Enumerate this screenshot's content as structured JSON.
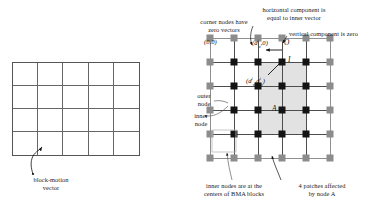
{
  "figure": {
    "left_panel": {
      "grid": {
        "cols": 5,
        "rows": 4
      },
      "arrow_caption": "block-motion\nvector"
    },
    "right_panel": {
      "mesh": {
        "cols": 6,
        "rows": 6
      },
      "annotations": {
        "corner_nodes": "corner nodes have\nzero vectors",
        "horizontal_component": "horizontal component is\nequal to inner vector",
        "vertical_component": "vertical component is zero",
        "outer_node": "outer\nnode",
        "inner_node": "inner\nnode",
        "inner_nodes_centers": "inner nodes are at the\ncenters of BMA blocks",
        "patches_affected": "4 patches affected\nby node A"
      },
      "labels": {
        "origin": "(0,0)",
        "outer_vector": "(d",
        "outer_vector_sup": "i",
        "outer_vector_sub": "x",
        "outer_vector_tail": ",0)",
        "inner_vector_open": "(d",
        "inner_vector_sup1": "i",
        "inner_vector_sub1": "x",
        "inner_vector_mid": ",d",
        "inner_vector_sup2": "i",
        "inner_vector_sub2": "y",
        "inner_vector_close": ")",
        "node_o": "O",
        "node_i": "I",
        "node_a": "A"
      }
    }
  },
  "colors": {
    "inner_node": "#141414",
    "outer_node": "#8c8c8c",
    "edge": "#4d4d4d",
    "patch_shade": "#e2e2e2",
    "grid_line": "#666666",
    "text": "#1a1a1a"
  }
}
